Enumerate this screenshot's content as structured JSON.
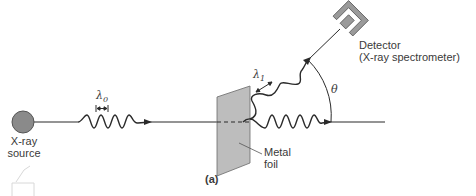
{
  "figure": {
    "panel_label": "(a)",
    "source": {
      "line1": "X-ray",
      "line2": "source"
    },
    "detector": {
      "line1": "Detector",
      "line2": "(X-ray spectrometer)"
    },
    "foil": {
      "line1": "Metal",
      "line2": "foil"
    },
    "incident_wavelength": {
      "symbol": "λ",
      "subscript": "0"
    },
    "scattered_wavelength": {
      "symbol": "λ",
      "subscript": "1"
    },
    "angle": "θ",
    "colors": {
      "line": "#2a2a2a",
      "source_fill": "#8a8a8a",
      "foil_fill": "#bdbdbd",
      "detector_fill": "#9a9a9a",
      "text": "#3a3a3a"
    }
  }
}
